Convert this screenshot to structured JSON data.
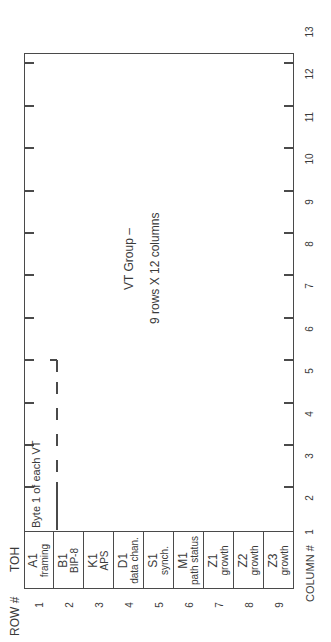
{
  "figure": {
    "orientation": "rotated -90 degrees",
    "title": "VT Group –",
    "subtitle": "9 rows X 12 columns",
    "byte_label": "Byte 1 of each VT"
  },
  "headers": {
    "row_header": "ROW #",
    "toh_header": "TOH",
    "column_header": "COLUMN #"
  },
  "toh_rows": [
    {
      "row": "1",
      "code": "A1",
      "desc": "framing"
    },
    {
      "row": "2",
      "code": "B1",
      "desc": "BIP-8"
    },
    {
      "row": "3",
      "code": "K1",
      "desc": "APS"
    },
    {
      "row": "4",
      "code": "D1",
      "desc": "data chan."
    },
    {
      "row": "5",
      "code": "S1",
      "desc": "synch."
    },
    {
      "row": "6",
      "code": "M1",
      "desc": "path status"
    },
    {
      "row": "7",
      "code": "Z1",
      "desc": "growth"
    },
    {
      "row": "8",
      "code": "Z2",
      "desc": "growth"
    },
    {
      "row": "9",
      "code": "Z3",
      "desc": "growth"
    }
  ],
  "columns": [
    "1",
    "2",
    "3",
    "4",
    "5",
    "6",
    "7",
    "8",
    "9",
    "10",
    "11",
    "12",
    "13"
  ],
  "colors": {
    "line": "#4a4a4a",
    "text": "#3a3a3a",
    "background": "#ffffff"
  }
}
